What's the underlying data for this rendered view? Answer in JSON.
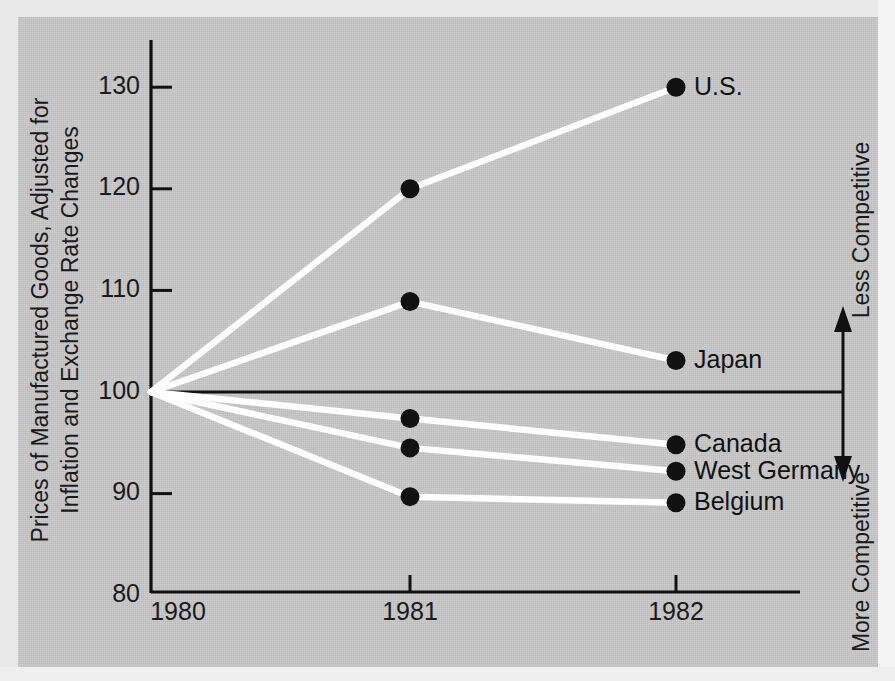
{
  "figure": {
    "background_color": "#c9c9c9",
    "line_color": "#ffffff",
    "marker_color": "#111111",
    "axis_color": "#111111"
  },
  "axis_title": {
    "line1": "Prices of Manufactured Goods, Adjusted for",
    "line2": "Inflation and Exchange Rate Changes"
  },
  "side_notes": {
    "upper": "Less Competitive",
    "lower": "More Competitive"
  },
  "chart_data": {
    "type": "line",
    "title": "",
    "subtitle": "",
    "xlabel": "",
    "ylabel": "Prices of Manufactured Goods, Adjusted for Inflation and Exchange Rate Changes",
    "x": [
      "1980",
      "1981",
      "1982"
    ],
    "xtick_labels": [
      "1980",
      "1981",
      "1982"
    ],
    "ytick_labels": [
      "130",
      "120",
      "110",
      "100",
      "90",
      "80"
    ],
    "yticks": [
      130,
      120,
      110,
      100,
      90,
      80
    ],
    "ylim": [
      80,
      133
    ],
    "grid": false,
    "legend": "inline-right-of-last-point",
    "reference_line": 100,
    "annotations": [
      "Less Competitive",
      "More Competitive"
    ],
    "series": [
      {
        "name": "U.S.",
        "values": [
          100,
          120.0,
          130.0
        ]
      },
      {
        "name": "Japan",
        "values": [
          100,
          108.9,
          103.1
        ]
      },
      {
        "name": "Canada",
        "values": [
          100,
          97.4,
          94.8
        ]
      },
      {
        "name": "West Germany",
        "values": [
          100,
          94.5,
          92.2
        ]
      },
      {
        "name": "Belgium",
        "values": [
          100,
          89.7,
          89.1
        ]
      }
    ]
  }
}
